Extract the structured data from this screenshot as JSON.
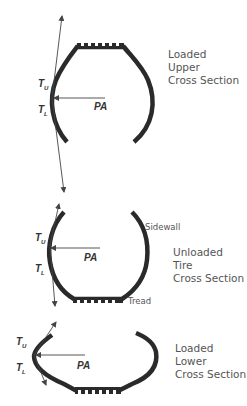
{
  "diagram": {
    "type": "tire cross-section force diagram",
    "colors": {
      "tire": "#2a2a2a",
      "arrow": "#444444",
      "text": "#555555",
      "background": "#ffffff"
    },
    "sections": [
      {
        "id": "loaded-upper",
        "caption": [
          "Loaded",
          "Upper",
          "Cross Section"
        ],
        "symbols": {
          "tu": "T",
          "tu_sub": "U",
          "tl": "T",
          "tl_sub": "L",
          "pa": "PA"
        }
      },
      {
        "id": "unloaded",
        "caption": [
          "Unloaded",
          "Tire",
          "Cross Section"
        ],
        "symbols": {
          "tu": "T",
          "tu_sub": "U",
          "tl": "T",
          "tl_sub": "L",
          "pa": "PA"
        },
        "part_labels": {
          "sidewall": "Sidewall",
          "tread": "Tread"
        }
      },
      {
        "id": "loaded-lower",
        "caption": [
          "Loaded",
          "Lower",
          "Cross Section"
        ],
        "symbols": {
          "tu": "T",
          "tu_sub": "U",
          "tl": "T",
          "tl_sub": "L",
          "pa": "PA"
        }
      }
    ]
  }
}
